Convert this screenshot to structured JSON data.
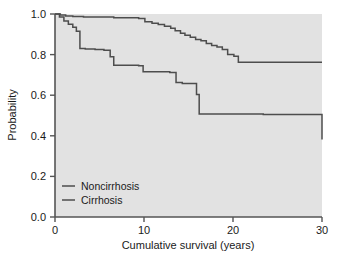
{
  "chart_data": {
    "type": "line",
    "title": "",
    "xlabel": "Cumulative survival (years)",
    "ylabel": "Probability",
    "xlim": [
      0,
      30
    ],
    "ylim": [
      0,
      1.0
    ],
    "xticks": [
      0,
      10,
      20,
      30
    ],
    "xticklabels": [
      "0",
      "10",
      "20",
      "30"
    ],
    "yticks": [
      0.0,
      0.2,
      0.4,
      0.6,
      0.8,
      1.0
    ],
    "yticklabels": [
      "0.0",
      "0.2",
      "0.4",
      "0.6",
      "0.8",
      "1.0"
    ],
    "grid": false,
    "legend_position": "lower left",
    "plot_background": "#e2e2e2",
    "line_color": "#4d4d4d",
    "series": [
      {
        "name": "Noncirrhosis",
        "step": true,
        "x": [
          0,
          0.6,
          1.2,
          2.0,
          3.2,
          6.6,
          9.4,
          10.1,
          10.9,
          11.6,
          12.3,
          13.0,
          13.5,
          14.1,
          14.6,
          15.2,
          15.8,
          16.4,
          17.0,
          17.6,
          18.2,
          18.8,
          19.4,
          20.1,
          20.6,
          30.0
        ],
        "y": [
          1.0,
          0.995,
          0.99,
          0.988,
          0.985,
          0.982,
          0.978,
          0.962,
          0.955,
          0.948,
          0.94,
          0.93,
          0.918,
          0.905,
          0.895,
          0.885,
          0.875,
          0.868,
          0.855,
          0.845,
          0.838,
          0.825,
          0.8,
          0.792,
          0.762,
          0.762
        ]
      },
      {
        "name": "Cirrhosis",
        "step": true,
        "x": [
          0,
          0.5,
          1.0,
          1.5,
          2.0,
          2.4,
          2.8,
          3.4,
          4.5,
          5.5,
          6.2,
          6.6,
          9.4,
          9.9,
          12.9,
          13.6,
          14.3,
          15.9,
          16.2,
          23.4,
          30.0
        ],
        "y": [
          1.0,
          0.985,
          0.965,
          0.95,
          0.935,
          0.915,
          0.83,
          0.828,
          0.825,
          0.822,
          0.79,
          0.748,
          0.745,
          0.715,
          0.712,
          0.662,
          0.658,
          0.603,
          0.508,
          0.505,
          0.382
        ]
      }
    ]
  },
  "legend": {
    "items": [
      {
        "label": "Noncirrhosis"
      },
      {
        "label": "Cirrhosis"
      }
    ]
  }
}
